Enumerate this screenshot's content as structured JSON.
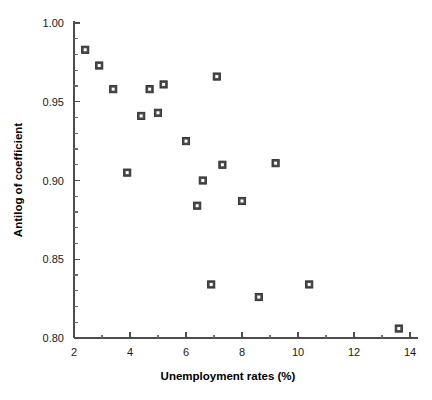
{
  "chart_data": {
    "type": "scatter",
    "title": "",
    "xlabel": "Unemployment rates (%)",
    "ylabel": "Antilog of coefficient",
    "xlim": [
      2,
      14
    ],
    "ylim": [
      0.8,
      1.0
    ],
    "grid": false,
    "legend": null,
    "x_ticks": [
      2,
      4,
      6,
      8,
      10,
      12,
      14
    ],
    "x_tick_labels": [
      "2",
      "4",
      "6",
      "8",
      "10",
      "12",
      "14"
    ],
    "x_minor_step": 1,
    "y_ticks": [
      0.8,
      0.85,
      0.9,
      0.95,
      1.0
    ],
    "y_tick_labels": [
      "0.80",
      "0.85",
      "0.90",
      "0.95",
      "1.00"
    ],
    "y_minor_step": 0.01,
    "marker": "square-open",
    "marker_color": "#4a4a4a",
    "points": [
      {
        "x": 2.4,
        "y": 0.983
      },
      {
        "x": 2.9,
        "y": 0.973
      },
      {
        "x": 3.4,
        "y": 0.958
      },
      {
        "x": 3.9,
        "y": 0.905
      },
      {
        "x": 4.4,
        "y": 0.941
      },
      {
        "x": 4.7,
        "y": 0.958
      },
      {
        "x": 5.2,
        "y": 0.961
      },
      {
        "x": 5.0,
        "y": 0.943
      },
      {
        "x": 6.0,
        "y": 0.925
      },
      {
        "x": 6.4,
        "y": 0.884
      },
      {
        "x": 6.6,
        "y": 0.9
      },
      {
        "x": 6.9,
        "y": 0.834
      },
      {
        "x": 7.1,
        "y": 0.966
      },
      {
        "x": 7.3,
        "y": 0.91
      },
      {
        "x": 8.0,
        "y": 0.887
      },
      {
        "x": 8.6,
        "y": 0.826
      },
      {
        "x": 9.2,
        "y": 0.911
      },
      {
        "x": 10.4,
        "y": 0.834
      },
      {
        "x": 13.6,
        "y": 0.806
      }
    ]
  },
  "axes": {
    "x_axis_name": "x-axis",
    "y_axis_name": "y-axis"
  }
}
